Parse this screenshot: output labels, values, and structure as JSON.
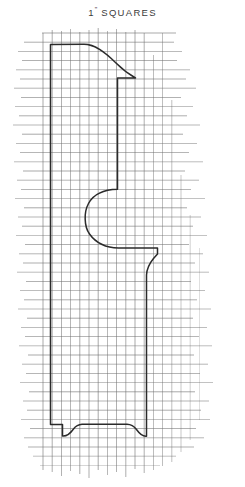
{
  "sheet": {
    "title_number": "1",
    "title_inch_mark": "\"",
    "title_word": "SQUARES",
    "background_color": "#ffffff",
    "grid_color": "#707070",
    "outline_color": "#2b2b2b"
  },
  "grid": {
    "square_size_label": "1\"",
    "spacing_px": 9.2,
    "origin_x": 43.0,
    "origin_y": 33.0,
    "columns": 15,
    "rows": 48,
    "line_width": 0.7,
    "outline_line_width": 1.5,
    "ragged_edges": true,
    "horizontal_lines": [
      {
        "y": 33.0,
        "x1": 42.0,
        "x2": 176.0,
        "opacity": 0.85
      },
      {
        "y": 42.2,
        "x1": 24.0,
        "x2": 174.0,
        "opacity": 0.8
      },
      {
        "y": 51.4,
        "x1": 18.0,
        "x2": 182.0,
        "opacity": 0.75
      },
      {
        "y": 60.6,
        "x1": 22.0,
        "x2": 177.0,
        "opacity": 0.85
      },
      {
        "y": 69.8,
        "x1": 16.0,
        "x2": 190.0,
        "opacity": 0.7
      },
      {
        "y": 79.0,
        "x1": 20.0,
        "x2": 186.0,
        "opacity": 0.8
      },
      {
        "y": 88.2,
        "x1": 14.0,
        "x2": 196.0,
        "opacity": 0.72
      },
      {
        "y": 97.4,
        "x1": 21.0,
        "x2": 181.0,
        "opacity": 0.85
      },
      {
        "y": 106.6,
        "x1": 15.0,
        "x2": 193.0,
        "opacity": 0.68
      },
      {
        "y": 115.8,
        "x1": 19.0,
        "x2": 187.0,
        "opacity": 0.8
      },
      {
        "y": 125.0,
        "x1": 13.0,
        "x2": 200.0,
        "opacity": 0.7
      },
      {
        "y": 134.2,
        "x1": 22.0,
        "x2": 183.0,
        "opacity": 0.85
      },
      {
        "y": 143.4,
        "x1": 16.0,
        "x2": 197.0,
        "opacity": 0.72
      },
      {
        "y": 152.6,
        "x1": 20.0,
        "x2": 189.0,
        "opacity": 0.8
      },
      {
        "y": 161.8,
        "x1": 14.0,
        "x2": 203.0,
        "opacity": 0.66
      },
      {
        "y": 171.0,
        "x1": 23.0,
        "x2": 185.0,
        "opacity": 0.85
      },
      {
        "y": 180.2,
        "x1": 17.0,
        "x2": 199.0,
        "opacity": 0.72
      },
      {
        "y": 189.4,
        "x1": 21.0,
        "x2": 191.0,
        "opacity": 0.8
      },
      {
        "y": 198.6,
        "x1": 15.0,
        "x2": 205.0,
        "opacity": 0.66
      },
      {
        "y": 207.8,
        "x1": 24.0,
        "x2": 187.0,
        "opacity": 0.85
      },
      {
        "y": 217.0,
        "x1": 18.0,
        "x2": 201.0,
        "opacity": 0.72
      },
      {
        "y": 226.2,
        "x1": 22.0,
        "x2": 193.0,
        "opacity": 0.8
      },
      {
        "y": 235.4,
        "x1": 16.0,
        "x2": 207.0,
        "opacity": 0.66
      },
      {
        "y": 244.6,
        "x1": 25.0,
        "x2": 189.0,
        "opacity": 0.85
      },
      {
        "y": 253.8,
        "x1": 19.0,
        "x2": 203.0,
        "opacity": 0.72
      },
      {
        "y": 263.0,
        "x1": 23.0,
        "x2": 195.0,
        "opacity": 0.8
      },
      {
        "y": 272.2,
        "x1": 17.0,
        "x2": 209.0,
        "opacity": 0.66
      },
      {
        "y": 281.4,
        "x1": 26.0,
        "x2": 191.0,
        "opacity": 0.85
      },
      {
        "y": 290.6,
        "x1": 20.0,
        "x2": 205.0,
        "opacity": 0.72
      },
      {
        "y": 299.8,
        "x1": 24.0,
        "x2": 197.0,
        "opacity": 0.8
      },
      {
        "y": 309.0,
        "x1": 18.0,
        "x2": 211.0,
        "opacity": 0.66
      },
      {
        "y": 318.2,
        "x1": 27.0,
        "x2": 193.0,
        "opacity": 0.85
      },
      {
        "y": 327.4,
        "x1": 21.0,
        "x2": 207.0,
        "opacity": 0.72
      },
      {
        "y": 336.6,
        "x1": 25.0,
        "x2": 199.0,
        "opacity": 0.8
      },
      {
        "y": 345.8,
        "x1": 19.0,
        "x2": 212.0,
        "opacity": 0.66
      },
      {
        "y": 355.0,
        "x1": 28.0,
        "x2": 194.0,
        "opacity": 0.85
      },
      {
        "y": 364.2,
        "x1": 22.0,
        "x2": 208.0,
        "opacity": 0.72
      },
      {
        "y": 373.4,
        "x1": 26.0,
        "x2": 200.0,
        "opacity": 0.8
      },
      {
        "y": 382.6,
        "x1": 20.0,
        "x2": 213.0,
        "opacity": 0.66
      },
      {
        "y": 391.8,
        "x1": 29.0,
        "x2": 195.0,
        "opacity": 0.85
      },
      {
        "y": 401.0,
        "x1": 23.0,
        "x2": 209.0,
        "opacity": 0.72
      },
      {
        "y": 410.2,
        "x1": 27.0,
        "x2": 201.0,
        "opacity": 0.8
      },
      {
        "y": 419.4,
        "x1": 21.0,
        "x2": 210.0,
        "opacity": 0.66
      },
      {
        "y": 428.6,
        "x1": 30.0,
        "x2": 196.0,
        "opacity": 0.85
      },
      {
        "y": 437.8,
        "x1": 24.0,
        "x2": 204.0,
        "opacity": 0.72
      },
      {
        "y": 447.0,
        "x1": 28.0,
        "x2": 194.0,
        "opacity": 0.78
      },
      {
        "y": 456.2,
        "x1": 33.0,
        "x2": 176.0,
        "opacity": 0.62
      },
      {
        "y": 465.4,
        "x1": 40.0,
        "x2": 160.0,
        "opacity": 0.45
      }
    ],
    "vertical_lines": [
      {
        "x": 43.0,
        "y1": 33.0,
        "y2": 470.0,
        "opacity": 0.85
      },
      {
        "x": 52.2,
        "y1": 30.0,
        "y2": 472.0,
        "opacity": 0.8
      },
      {
        "x": 61.4,
        "y1": 31.0,
        "y2": 476.0,
        "opacity": 0.85
      },
      {
        "x": 70.6,
        "y1": 29.0,
        "y2": 471.0,
        "opacity": 0.78
      },
      {
        "x": 79.8,
        "y1": 32.0,
        "y2": 474.0,
        "opacity": 0.85
      },
      {
        "x": 89.0,
        "y1": 30.0,
        "y2": 478.0,
        "opacity": 0.8
      },
      {
        "x": 98.2,
        "y1": 28.0,
        "y2": 470.0,
        "opacity": 0.85
      },
      {
        "x": 107.4,
        "y1": 31.0,
        "y2": 475.0,
        "opacity": 0.78
      },
      {
        "x": 116.6,
        "y1": 29.0,
        "y2": 472.0,
        "opacity": 0.85
      },
      {
        "x": 125.8,
        "y1": 32.0,
        "y2": 477.0,
        "opacity": 0.8
      },
      {
        "x": 135.0,
        "y1": 30.0,
        "y2": 469.0,
        "opacity": 0.85
      },
      {
        "x": 144.2,
        "y1": 33.0,
        "y2": 473.0,
        "opacity": 0.78
      },
      {
        "x": 153.4,
        "y1": 55.0,
        "y2": 470.0,
        "opacity": 0.72
      },
      {
        "x": 162.6,
        "y1": 33.0,
        "y2": 466.0,
        "opacity": 0.7
      },
      {
        "x": 171.8,
        "y1": 100.0,
        "y2": 462.0,
        "opacity": 0.62
      },
      {
        "x": 181.0,
        "y1": 175.0,
        "y2": 452.0,
        "opacity": 0.55
      },
      {
        "x": 190.2,
        "y1": 215.0,
        "y2": 440.0,
        "opacity": 0.45
      },
      {
        "x": 199.4,
        "y1": 248.0,
        "y2": 420.0,
        "opacity": 0.35
      }
    ]
  },
  "drawing": {
    "name": "chair-splat-profile",
    "description": "Full-size pattern outline on one-inch grid",
    "outline_path": "M 50.5 44.5 L 50.5 424.5 L 62.5 424.5 L 62.5 436.0 C 67.0 436.5 71.0 432.5 73.5 429.0 C 76.5 425.0 78.5 424.5 82.0 424.3 L 127.0 424.3 C 131.0 424.4 133.5 425.5 136.5 429.5 C 139.0 433.0 142.5 436.7 146.5 436.2 L 146.5 424.5 L 146.5 275.0 C 146.8 269.0 149.0 264.0 153.5 258.5 L 157.5 254.0 L 157.5 248.0 L 133.0 248.0 L 118.5 248.0 C 106.0 247.8 96.0 243.0 89.5 234.0 C 84.0 226.5 83.8 212.0 88.5 203.5 C 94.0 193.5 104.0 189.6 117.5 189.3 L 117.5 78.0 L 135.5 78.0 C 135.5 78.0 125.0 72.0 116.0 63.0 C 105.0 52.0 95.0 44.3 84.0 44.3 Z",
    "foot_left_x": 62.5,
    "foot_right_x": 146.5,
    "foot_top_y": 424.3,
    "foot_bottom_y": 436.4,
    "body_left_x": 50.5,
    "body_right_x": 117.5,
    "shoulder_top_y": 44.5,
    "notch_center_y": 219.0
  }
}
